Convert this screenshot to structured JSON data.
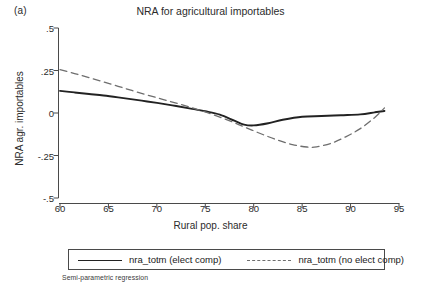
{
  "panel": {
    "label": "(a)"
  },
  "footnote": {
    "text": "Semi-parametric regression"
  },
  "legend": {
    "items": [
      {
        "label": "nra_totm (elect comp)",
        "style": "solid",
        "color": "#222222"
      },
      {
        "label": "nra_totm (no elect comp)",
        "style": "dashed",
        "color": "#6e6e6e"
      }
    ]
  },
  "colors": {
    "axis": "#4a4a4a",
    "solid_series": "#222222",
    "dashed_series": "#6e6e6e",
    "text": "#2b2b2b",
    "background": "#ffffff"
  },
  "chart_data": {
    "type": "line",
    "title": "NRA for agricultural importables",
    "xlabel": "Rural pop. share",
    "ylabel": "NRA agr. importables",
    "xlim": [
      58.5,
      96.5
    ],
    "ylim": [
      -0.58,
      0.56
    ],
    "xticks": [
      60,
      65,
      70,
      75,
      80,
      85,
      90,
      95
    ],
    "xticklabels": [
      "60",
      "65",
      "70",
      "75",
      "80",
      "85",
      "90",
      "95"
    ],
    "yticks": [
      0.5,
      0.25,
      0,
      -0.25,
      -0.5
    ],
    "yticklabels": [
      ".5",
      ".25",
      "0",
      "-.25",
      "-.5"
    ],
    "grid": false,
    "legend_position": "below-axes",
    "series": [
      {
        "name": "nra_totm (elect comp)",
        "style": "solid",
        "color": "#222222",
        "x": [
          60.0,
          61.5,
          63.0,
          64.5,
          66.0,
          67.5,
          69.0,
          70.5,
          72.0,
          73.5,
          75.0,
          76.5,
          78.0,
          79.0,
          80.0,
          81.5,
          83.0,
          85.0,
          87.0,
          89.0,
          91.0,
          92.5,
          93.5
        ],
        "y": [
          0.13,
          0.121,
          0.112,
          0.103,
          0.092,
          0.08,
          0.068,
          0.055,
          0.041,
          0.026,
          0.01,
          -0.01,
          -0.045,
          -0.068,
          -0.073,
          -0.06,
          -0.04,
          -0.022,
          -0.018,
          -0.013,
          -0.008,
          0.004,
          0.012
        ]
      },
      {
        "name": "nra_totm (no elect comp)",
        "style": "dashed",
        "color": "#6e6e6e",
        "x": [
          60.0,
          61.5,
          63.0,
          64.5,
          66.0,
          67.5,
          69.0,
          70.5,
          72.0,
          73.5,
          75.0,
          76.5,
          78.0,
          79.5,
          81.0,
          82.5,
          84.0,
          85.5,
          86.5,
          88.0,
          89.5,
          91.0,
          92.5,
          93.5
        ],
        "y": [
          0.255,
          0.232,
          0.208,
          0.183,
          0.157,
          0.131,
          0.106,
          0.082,
          0.058,
          0.033,
          0.006,
          -0.024,
          -0.057,
          -0.093,
          -0.128,
          -0.16,
          -0.186,
          -0.2,
          -0.199,
          -0.178,
          -0.14,
          -0.092,
          -0.026,
          0.03
        ]
      }
    ]
  }
}
